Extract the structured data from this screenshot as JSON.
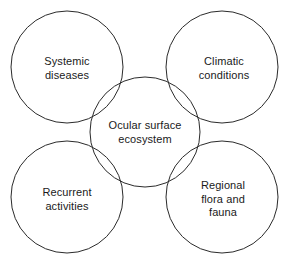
{
  "diagram": {
    "type": "venn-overlap",
    "canvas": {
      "width": 290,
      "height": 272,
      "background": "#ffffff"
    },
    "stroke_color": "#2b2b2b",
    "text_color": "#1a1a1a",
    "center": {
      "id": "ocular-surface-ecosystem",
      "label": "Ocular surface\necosystem",
      "cx": 145,
      "cy": 132,
      "r": 55,
      "label_x": 145,
      "label_y": 132
    },
    "nodes": [
      {
        "id": "systemic-diseases",
        "label": "Systemic\ndiseases",
        "position": "top-left",
        "cx": 67,
        "cy": 67,
        "r": 56,
        "label_x": 67,
        "label_y": 68
      },
      {
        "id": "climatic-conditions",
        "label": "Climatic\nconditions",
        "position": "top-right",
        "cx": 222,
        "cy": 67,
        "r": 56,
        "label_x": 224,
        "label_y": 68
      },
      {
        "id": "recurrent-activities",
        "label": "Recurrent\nactivities",
        "position": "bottom-left",
        "cx": 67,
        "cy": 197,
        "r": 56,
        "label_x": 67,
        "label_y": 199
      },
      {
        "id": "regional-flora-and-fauna",
        "label": "Regional\nflora and fauna",
        "position": "bottom-right",
        "cx": 222,
        "cy": 197,
        "r": 56,
        "label_x": 223,
        "label_y": 199
      }
    ]
  }
}
